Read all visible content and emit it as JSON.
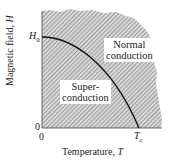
{
  "diagram": {
    "type": "phase-diagram",
    "title": "",
    "axes": {
      "x": {
        "label": "Temperature,",
        "label_var": "T",
        "ticks": [
          {
            "label": "0"
          },
          {
            "label_base": "T",
            "label_sub": "c"
          }
        ]
      },
      "y": {
        "label": "Magnetic field,",
        "label_var": "H",
        "ticks": [
          {
            "label": "0"
          },
          {
            "label_base": "H",
            "label_sub": "0"
          }
        ]
      }
    },
    "regions": [
      {
        "id": "normal",
        "line1": "Normal",
        "line2": "conduction"
      },
      {
        "id": "super",
        "line1": "Super-",
        "line2": "conduction"
      }
    ],
    "boundary": {
      "description": "Critical field curve H_c(T) from H0 at T=0 to 0 at Tc",
      "shape": "parabolic"
    },
    "colors": {
      "hatch": "#8a8a8a",
      "curve": "#111111",
      "axis": "#333333",
      "background": "#ffffff"
    }
  }
}
